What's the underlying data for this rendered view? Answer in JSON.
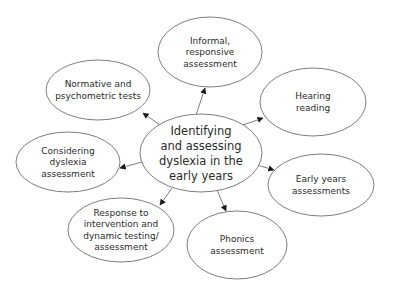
{
  "diagram": {
    "type": "mind-map",
    "center": {
      "id": "center",
      "lines": [
        "Identifying",
        "and assessing",
        "dyslexia in the",
        "early years"
      ],
      "cx": 201,
      "cy": 153,
      "rx": 61,
      "ry": 39
    },
    "nodes": [
      {
        "id": "informal",
        "lines": [
          "Informal,",
          "responsive",
          "assessment"
        ],
        "cx": 210,
        "cy": 52,
        "rx": 52,
        "ry": 35
      },
      {
        "id": "normative",
        "lines": [
          "Normative and",
          "psychometric tests"
        ],
        "cx": 98,
        "cy": 90,
        "rx": 52,
        "ry": 30
      },
      {
        "id": "hearing",
        "lines": [
          "Hearing",
          "reading"
        ],
        "cx": 313,
        "cy": 102,
        "rx": 53,
        "ry": 34
      },
      {
        "id": "considering",
        "lines": [
          "Considering",
          "dyslexia",
          "assessment"
        ],
        "cx": 68,
        "cy": 162,
        "rx": 52,
        "ry": 30
      },
      {
        "id": "early-years",
        "lines": [
          "Early years",
          "assessments"
        ],
        "cx": 321,
        "cy": 185,
        "rx": 53,
        "ry": 31
      },
      {
        "id": "response",
        "lines": [
          "Response to",
          "intervention and",
          "dynamic testing/",
          "assessment"
        ],
        "cx": 121,
        "cy": 230,
        "rx": 53,
        "ry": 32
      },
      {
        "id": "phonics",
        "lines": [
          "Phonics",
          "assessment"
        ],
        "cx": 237,
        "cy": 245,
        "rx": 50,
        "ry": 34
      }
    ],
    "edges": [
      {
        "from": [
          196,
          115
        ],
        "to": [
          205,
          88
        ]
      },
      {
        "from": [
          160,
          125
        ],
        "to": [
          143,
          113
        ]
      },
      {
        "from": [
          243,
          125
        ],
        "to": [
          263,
          118
        ]
      },
      {
        "from": [
          142,
          162
        ],
        "to": [
          120,
          168
        ]
      },
      {
        "from": [
          257,
          165
        ],
        "to": [
          274,
          170
        ]
      },
      {
        "from": [
          172,
          188
        ],
        "to": [
          160,
          205
        ]
      },
      {
        "from": [
          217,
          190
        ],
        "to": [
          226,
          211
        ]
      }
    ],
    "colors": {
      "stroke": "#6e6e6e",
      "text": "#2b2b2b",
      "background": "#ffffff"
    }
  }
}
